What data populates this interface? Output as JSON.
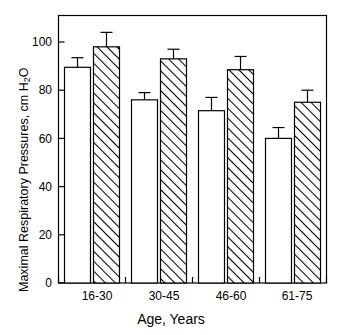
{
  "chart_data": {
    "type": "bar",
    "title": "",
    "xlabel": "Age, Years",
    "ylabel": "Maximal Respiratory Pressures, cm H2O",
    "ylabel_parts": {
      "pre": "Maximal Respiratory Pressures, cm H",
      "sub": "2",
      "post": "O"
    },
    "categories": [
      "16-30",
      "30-45",
      "46-60",
      "61-75"
    ],
    "ylim": [
      0,
      110
    ],
    "yticks": [
      0,
      20,
      40,
      60,
      80,
      100
    ],
    "ytick_labels": [
      "0",
      "20",
      "40",
      "60",
      "80",
      "100"
    ],
    "grid": false,
    "legend": "none",
    "series": [
      {
        "name": "open-bars",
        "fill": "open",
        "values": [
          89.5,
          76.0,
          71.5,
          60.0
        ],
        "errors": [
          4.0,
          3.0,
          5.5,
          4.5
        ]
      },
      {
        "name": "hatched-bars",
        "fill": "diagonal-hatch",
        "values": [
          98.0,
          93.0,
          88.5,
          75.0
        ],
        "errors": [
          6.0,
          4.0,
          5.5,
          5.0
        ]
      }
    ],
    "colors": {
      "axis": "#000000",
      "bar_edge": "#000000",
      "bar_fill": "#ffffff",
      "hatch": "#000000"
    }
  }
}
